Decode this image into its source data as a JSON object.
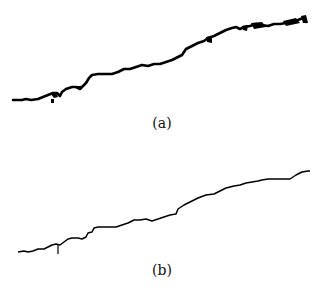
{
  "figure": {
    "panels": [
      {
        "id": "a",
        "caption": "(a)",
        "description": "rough irregular black profile line rising left to right with blob artifacts",
        "stroke": "#000000",
        "stroke_width": 3
      },
      {
        "id": "b",
        "caption": "(b)",
        "description": "thin smoothed profile line rising left to right",
        "stroke": "#000000",
        "stroke_width": 1.5
      }
    ],
    "footer_partial_text": "(c) (d) ... (cut off)"
  }
}
